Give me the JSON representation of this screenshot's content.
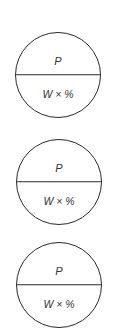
{
  "diagram": {
    "type": "percent-circle",
    "line_color": "#2a2a2a",
    "circles": [
      {
        "top": "P",
        "bottom": "W × %"
      },
      {
        "top": "P",
        "bottom": "W × %"
      },
      {
        "top": "P",
        "bottom": "W × %"
      }
    ]
  }
}
